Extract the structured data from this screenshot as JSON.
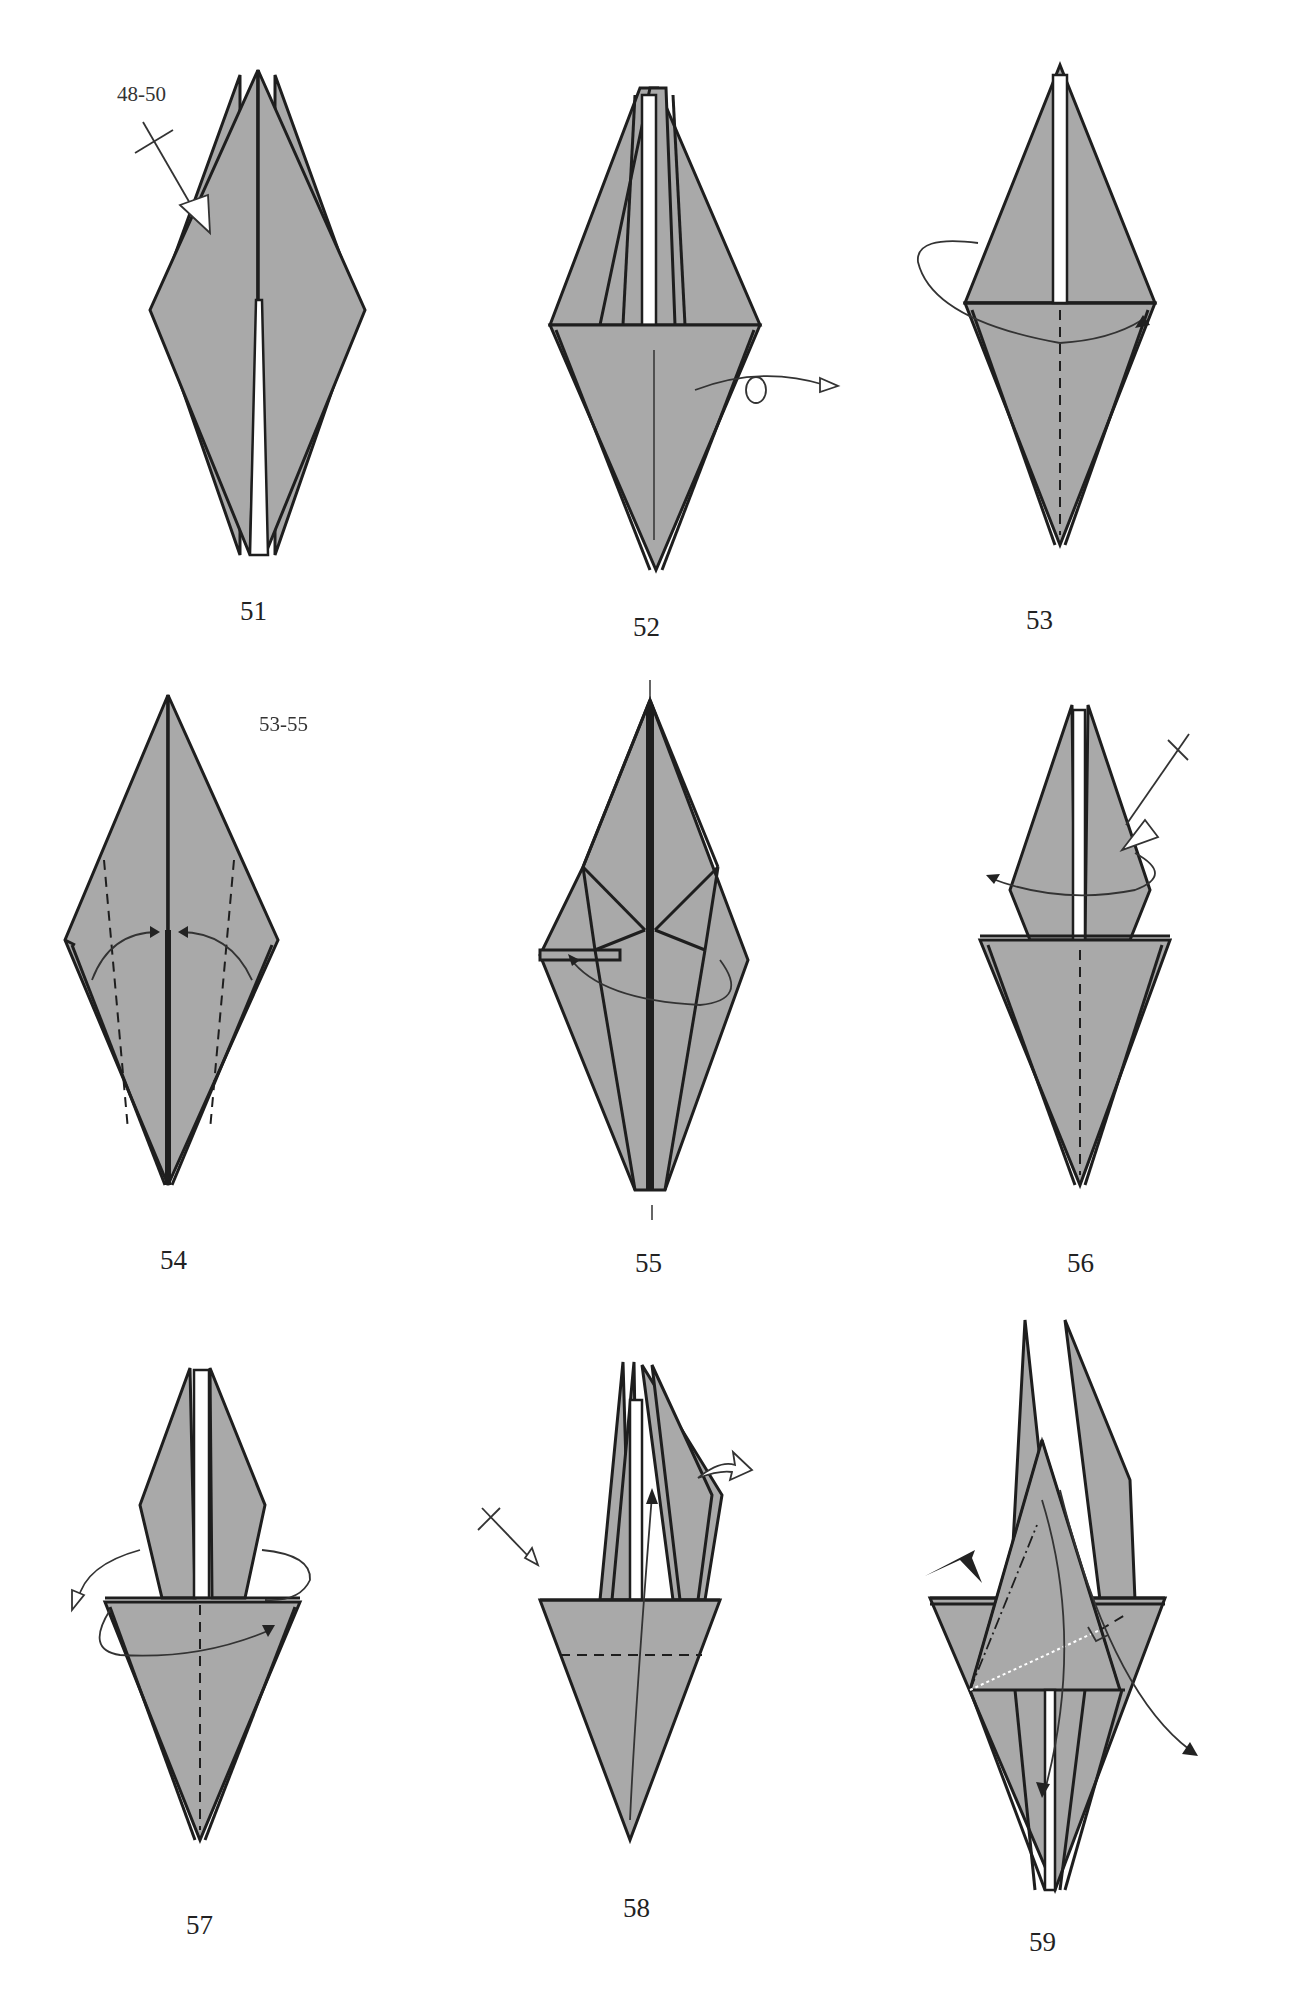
{
  "page": {
    "background": "#ffffff",
    "paper_color": "#a9a9a9",
    "line_color": "#1e1e1e"
  },
  "steps": [
    {
      "number": "51",
      "ref_label": "48-50",
      "symbols": [
        "repeat-steps-arrow"
      ]
    },
    {
      "number": "52",
      "symbols": [
        "turn-over-arrow"
      ]
    },
    {
      "number": "53",
      "symbols": [
        "valley-fold-line",
        "fold-behind-arrow"
      ]
    },
    {
      "number": "54",
      "symbols": [
        "valley-fold-lines",
        "fold-to-center-arrows"
      ]
    },
    {
      "number": "55",
      "symbols": [
        "fold-arrow",
        "center-line-marks"
      ]
    },
    {
      "number": "56",
      "ref_label": "53-55",
      "symbols": [
        "repeat-steps-arrow",
        "fold-arrow",
        "valley-fold-line"
      ]
    },
    {
      "number": "57",
      "symbols": [
        "valley-fold-line",
        "fold-and-unfold-arrow"
      ]
    },
    {
      "number": "58",
      "symbols": [
        "repeat-arrow",
        "valley-fold-line",
        "fold-up-arrow",
        "unfold-arrow"
      ]
    },
    {
      "number": "59",
      "symbols": [
        "sink-arrow",
        "mountain-fold-line",
        "right-angle-mark",
        "fold-down-arrows"
      ]
    }
  ]
}
